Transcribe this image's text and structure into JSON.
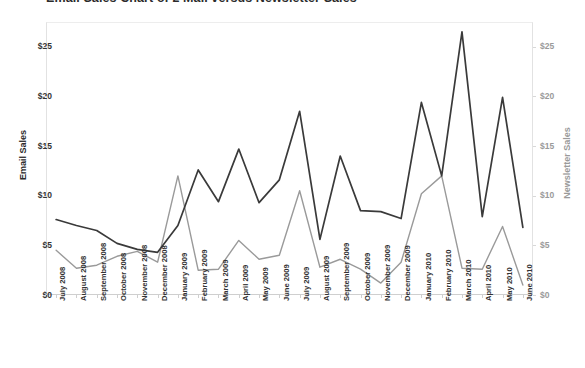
{
  "title": "Email Sales Chart of 2 Mail versus Newsletter Sales",
  "axes": {
    "y_left_title": "Email Sales",
    "y_right_title": "Newsletter Sales",
    "y_left_ticks": [
      "$0",
      "$5",
      "$10",
      "$15",
      "$20",
      "$25"
    ],
    "y_right_ticks": [
      "$0",
      "$5",
      "$10",
      "$15",
      "$20",
      "$25"
    ]
  },
  "colors": {
    "email_line": "#3a3a3a",
    "newsletter_line": "#9a9a9a",
    "frame": "#e2e2e2",
    "background": "#ffffff"
  },
  "chart_data": {
    "type": "line",
    "title": "Email Sales Chart of 2 Mail versus Newsletter Sales",
    "xlabel": "",
    "ylabel": "Email Sales",
    "y2label": "Newsletter Sales",
    "ylim": [
      0,
      27.5
    ],
    "y2lim": [
      0,
      27.5
    ],
    "grid": false,
    "legend": "none",
    "categories": [
      "July 2008",
      "August 2008",
      "September 2008",
      "October 2008",
      "November 2008",
      "December 2008",
      "January 2009",
      "February 2009",
      "March 2009",
      "April 2009",
      "May 2009",
      "June 2009",
      "July 2009",
      "August 2009",
      "September 2009",
      "October 2009",
      "November 2009",
      "December 2009",
      "January 2010",
      "February 2010",
      "March 2010",
      "April 2010",
      "May 2010",
      "June 2010"
    ],
    "series": [
      {
        "name": "Email Sales",
        "axis": "left",
        "color": "#3a3a3a",
        "values": [
          7.6,
          7.0,
          6.5,
          5.2,
          4.6,
          4.3,
          7.0,
          12.6,
          9.4,
          14.7,
          9.3,
          11.6,
          18.5,
          5.6,
          14.0,
          8.5,
          8.4,
          7.7,
          19.4,
          12.0,
          26.5,
          7.9,
          19.9,
          6.8
        ]
      },
      {
        "name": "Newsletter Sales",
        "axis": "right",
        "color": "#9a9a9a",
        "values": [
          4.5,
          2.7,
          3.0,
          3.9,
          4.4,
          3.3,
          12.0,
          2.5,
          2.6,
          5.5,
          3.6,
          4.0,
          10.5,
          2.8,
          3.6,
          2.6,
          1.2,
          3.3,
          10.2,
          12.0,
          2.7,
          2.6,
          6.9,
          1.0
        ]
      }
    ]
  }
}
